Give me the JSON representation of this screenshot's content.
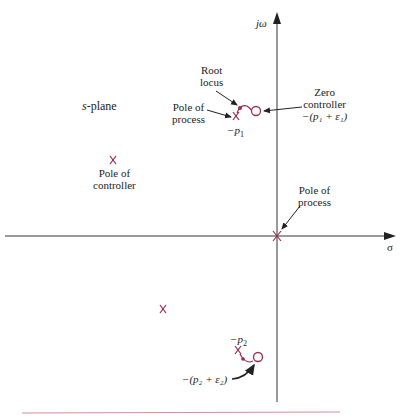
{
  "diagram": {
    "plane_label_var": "s",
    "plane_label_rest": "-plane",
    "axes": {
      "imag_label": "jω",
      "real_label": "σ"
    },
    "annotations": {
      "root_locus": [
        "Root",
        "locus"
      ],
      "pole_process_upper": [
        "Pole of",
        "process"
      ],
      "neg_p1": "−p",
      "neg_p1_sub": "1",
      "zero_controller": [
        "Zero",
        "controller",
        "−(p₁ + ε₁)"
      ],
      "pole_controller": [
        "Pole of",
        "controller"
      ],
      "pole_process_origin": [
        "Pole of",
        "process"
      ],
      "neg_p2": "−p",
      "neg_p2_sub": "2",
      "zero_lower": "−(p₂ + ε₂)"
    },
    "colors": {
      "marker": "#9b2a4f",
      "axis": "#222222",
      "rule": "#d98a9a"
    }
  }
}
